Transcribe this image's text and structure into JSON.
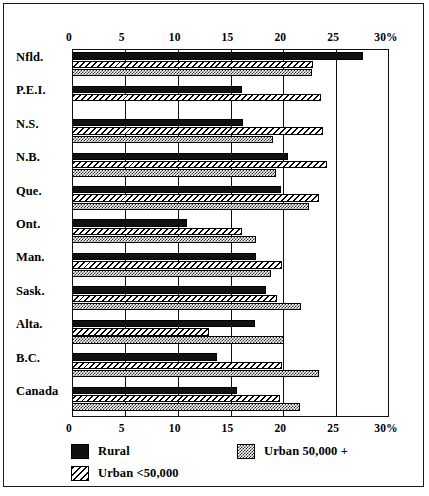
{
  "chart_data": {
    "type": "bar",
    "orientation": "horizontal",
    "title": "",
    "xlabel": "",
    "ylabel": "",
    "xlim": [
      0,
      30
    ],
    "xticks": [
      0,
      5,
      10,
      15,
      20,
      25,
      30
    ],
    "xtick_labels": [
      "0",
      "5",
      "10",
      "15",
      "20",
      "25",
      "30%"
    ],
    "grid": "vertical",
    "categories": [
      "Nfld.",
      "P.E.I.",
      "N.S.",
      "N.B.",
      "Que.",
      "Ont.",
      "Man.",
      "Sask.",
      "Alta.",
      "B.C.",
      "Canada"
    ],
    "legend_position": "bottom",
    "series": [
      {
        "name": "Rural",
        "pattern": "solid-black",
        "values": [
          27.5,
          16.1,
          16.2,
          20.4,
          19.8,
          10.9,
          17.4,
          18.4,
          17.3,
          13.7,
          15.6
        ]
      },
      {
        "name": "Urban <50,000",
        "pattern": "diagonal-hatch",
        "values": [
          22.8,
          23.6,
          23.8,
          24.1,
          23.4,
          16.1,
          19.9,
          19.4,
          13.0,
          19.9,
          19.7
        ]
      },
      {
        "name": "Urban 50,000 +",
        "pattern": "gray-stipple",
        "values": [
          22.7,
          null,
          19.0,
          19.3,
          22.4,
          17.4,
          18.8,
          21.7,
          20.1,
          23.4,
          21.6
        ]
      }
    ]
  },
  "axis": {
    "ticks": [
      {
        "label": "0",
        "value": 0
      },
      {
        "label": "5",
        "value": 5
      },
      {
        "label": "10",
        "value": 10
      },
      {
        "label": "15",
        "value": 15
      },
      {
        "label": "20",
        "value": 20
      },
      {
        "label": "25",
        "value": 25
      },
      {
        "label": "30%",
        "value": 30
      }
    ]
  },
  "legend": {
    "items": [
      {
        "label": "Rural",
        "pattern": "solid-black"
      },
      {
        "label": "Urban 50,000 +",
        "pattern": "gray-stipple"
      },
      {
        "label": "Urban <50,000",
        "pattern": "diagonal-hatch"
      }
    ]
  },
  "colors": {
    "rural": "#111111",
    "urban_small_fill": "#ffffff",
    "urban_small_hatch": "#000000",
    "urban_large": "#2b2b2b",
    "frame": "#1a1a1a",
    "background": "#ffffff"
  }
}
